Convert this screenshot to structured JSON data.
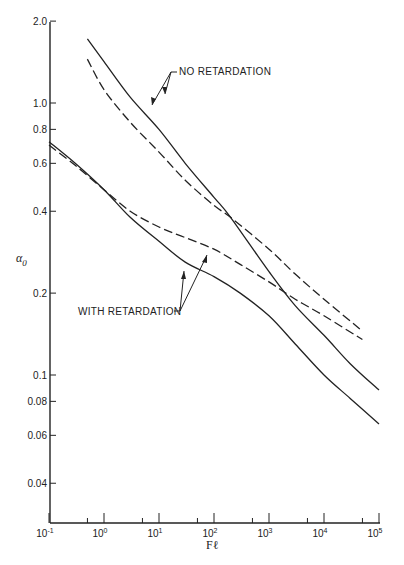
{
  "chart_data": {
    "type": "line",
    "title": "",
    "xlabel": "Fℓ",
    "ylabel": "α₀",
    "xscale": "log",
    "yscale": "log",
    "xlim": [
      0.1,
      100000
    ],
    "ylim": [
      0.03,
      2.0
    ],
    "grid": false,
    "x_ticks": [
      {
        "value": 0.1,
        "label": "10",
        "exp": "-1"
      },
      {
        "value": 1,
        "label": "10",
        "exp": "0"
      },
      {
        "value": 10,
        "label": "10",
        "exp": "1"
      },
      {
        "value": 100,
        "label": "10",
        "exp": "2"
      },
      {
        "value": 1000,
        "label": "10",
        "exp": "3"
      },
      {
        "value": 10000,
        "label": "10",
        "exp": "4"
      },
      {
        "value": 100000,
        "label": "10",
        "exp": "5"
      }
    ],
    "x_minor_ticks": [
      0.5,
      5,
      50,
      500,
      5000,
      50000
    ],
    "y_ticks": [
      {
        "value": 2.0,
        "label": "2.0"
      },
      {
        "value": 1.0,
        "label": "1.0"
      },
      {
        "value": 0.8,
        "label": "0.8"
      },
      {
        "value": 0.6,
        "label": "0.6"
      },
      {
        "value": 0.4,
        "label": "0.4"
      },
      {
        "value": 0.2,
        "label": "0.2"
      },
      {
        "value": 0.1,
        "label": "0.1"
      },
      {
        "value": 0.08,
        "label": "0.08"
      },
      {
        "value": 0.06,
        "label": "0.06"
      },
      {
        "value": 0.04,
        "label": "0.04"
      }
    ],
    "series": [
      {
        "name": "No retardation (solid)",
        "group": "NO RETARDATION",
        "style": "solid",
        "x": [
          0.5,
          1,
          3,
          10,
          30,
          100,
          200,
          1000,
          3000,
          10000,
          30000,
          100000
        ],
        "y": [
          1.72,
          1.42,
          1.05,
          0.8,
          0.6,
          0.45,
          0.38,
          0.24,
          0.18,
          0.14,
          0.11,
          0.088
        ]
      },
      {
        "name": "No retardation (dashed)",
        "group": "NO RETARDATION",
        "style": "dashed",
        "x": [
          0.5,
          1,
          3,
          10,
          30,
          100,
          200,
          1000,
          3000,
          10000,
          50000
        ],
        "y": [
          1.45,
          1.12,
          0.85,
          0.66,
          0.52,
          0.42,
          0.38,
          0.29,
          0.235,
          0.19,
          0.145
        ]
      },
      {
        "name": "With retardation (solid)",
        "group": "WITH RETARDATION",
        "style": "solid",
        "x": [
          0.1,
          0.3,
          1,
          3,
          10,
          30,
          100,
          300,
          1000,
          3000,
          10000,
          30000,
          100000
        ],
        "y": [
          0.72,
          0.6,
          0.48,
          0.38,
          0.31,
          0.26,
          0.23,
          0.2,
          0.165,
          0.13,
          0.1,
          0.082,
          0.066
        ]
      },
      {
        "name": "With retardation (dashed)",
        "group": "WITH RETARDATION",
        "style": "dashed",
        "x": [
          0.1,
          0.3,
          1,
          3,
          10,
          30,
          100,
          300,
          1000,
          3000,
          10000,
          50000
        ],
        "y": [
          0.7,
          0.59,
          0.48,
          0.4,
          0.35,
          0.32,
          0.29,
          0.255,
          0.22,
          0.19,
          0.165,
          0.135
        ]
      }
    ],
    "annotations": [
      {
        "text": "NO RETARDATION",
        "points_to": [
          "No retardation (solid)",
          "No retardation (dashed)"
        ]
      },
      {
        "text": "WITH RETARDATION",
        "points_to": [
          "With retardation (solid)",
          "With retardation (dashed)"
        ]
      }
    ]
  },
  "labels": {
    "xlabel": "Fℓ",
    "ylabel": "α",
    "ylabel_sub": "0",
    "no_ret": "NO RETARDATION",
    "with_ret": "WITH RETARDATION"
  }
}
